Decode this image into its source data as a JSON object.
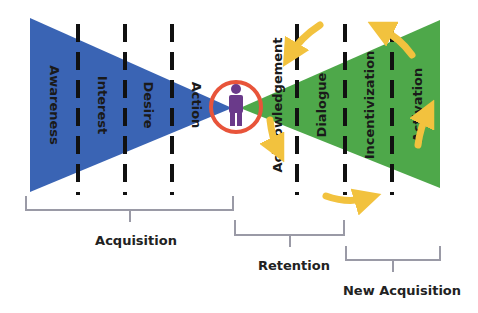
{
  "diagram": {
    "colors": {
      "acquisition_funnel": "#3a64b4",
      "retention_funnel": "#4ea84a",
      "customer_figure": "#6a3a8a",
      "customer_ring": "#e8543a",
      "cycle_arrows": "#f2c23e",
      "divider_lines": "#111111",
      "braces": "#9a9aa6"
    },
    "left_funnel": {
      "stages": [
        "Awareness",
        "Interest",
        "Desire",
        "Action"
      ]
    },
    "center": {
      "icon": "person-icon",
      "ring": "circle-highlight"
    },
    "right_funnel": {
      "stages": [
        "Acknowledgement",
        "Dialogue",
        "Incentivization",
        "Activation"
      ]
    },
    "braces": [
      {
        "label": "Acquisition"
      },
      {
        "label": "Retention"
      },
      {
        "label": "New Acquisition"
      }
    ]
  }
}
